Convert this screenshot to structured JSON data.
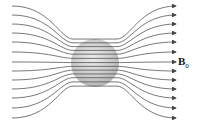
{
  "diagram": {
    "title": "",
    "field_label": "B",
    "field_label_subscript": "0",
    "sphere": {
      "cx": 95,
      "cy": 63,
      "r": 24,
      "fill": "#c8c8c8"
    },
    "line_color": "#555555",
    "field_lines_count": 13,
    "end_y": [
      6,
      15,
      24,
      33,
      42,
      52,
      62,
      71,
      80,
      89,
      98,
      108,
      118
    ],
    "start_y": [
      6,
      15,
      24,
      33,
      42,
      52,
      62,
      71,
      80,
      89,
      98,
      108,
      118
    ]
  }
}
